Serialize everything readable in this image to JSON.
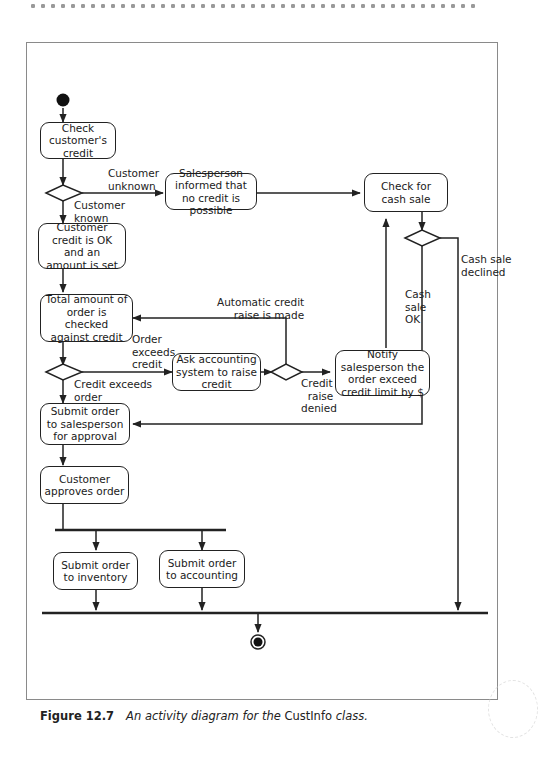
{
  "nodes": {
    "check_credit": "Check customer's credit",
    "salesperson_informed": "Salesperson informed that no credit is possible",
    "check_cash_sale": "Check for cash sale",
    "credit_ok": "Customer credit is OK and an amount is set",
    "total_checked": "Total amount of order is checked against credit",
    "ask_accounting": "Ask accounting system to raise credit",
    "notify_salesperson": "Notify salesperson the order exceed credit limit by $",
    "submit_salesperson": "Submit order to salesperson for approval",
    "customer_approves": "Customer approves order",
    "submit_inventory": "Submit order to inventory",
    "submit_accounting": "Submit order to accounting"
  },
  "guards": {
    "customer_unknown": "Customer\nunknown",
    "customer_known": "Customer\nknown",
    "cash_sale_declined": "Cash sale\ndeclined",
    "cash_sale_ok": "Cash\nsale\nOK",
    "automatic_raise": "Automatic credit\n     raise is made",
    "order_exceeds": "Order\nexceeds\ncredit",
    "credit_exceeds": "Credit exceeds\norder",
    "credit_raise_denied": "Credit\n  raise\ndenied"
  },
  "caption": {
    "figure": "Figure 12.7",
    "text_a": "An activity diagram for the ",
    "class_name": "CustInfo",
    "text_b": " class."
  },
  "colors": {
    "line": "#222222",
    "frame": "#8a8a8a"
  }
}
